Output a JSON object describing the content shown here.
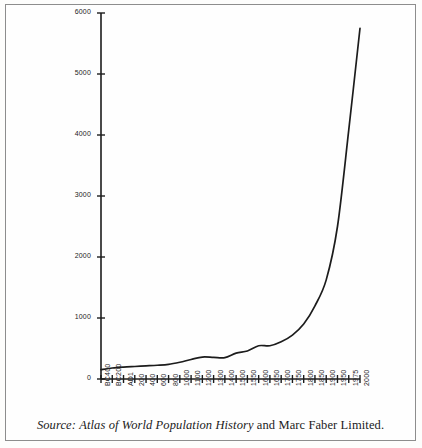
{
  "figure": {
    "border_color": "#8d8d8d",
    "background": "#fefefe"
  },
  "caption": {
    "source_label": "Source:",
    "title_italic": "Atlas of World Population History",
    "tail": "and Marc Faber Limited."
  },
  "chart_data": {
    "type": "line",
    "title": "",
    "xlabel": "",
    "ylabel": "",
    "ylim": [
      0,
      6000
    ],
    "grid": false,
    "legend": null,
    "line_color": "#1c1c1c",
    "y_ticks": [
      0,
      1000,
      2000,
      3000,
      4000,
      5000,
      6000
    ],
    "y_tick_labels": [
      "0",
      "1000",
      "2000",
      "3000",
      "4000",
      "5000",
      "6000"
    ],
    "categories": [
      "BC400",
      "BC200",
      "AD1",
      "200",
      "400",
      "600",
      "800",
      "1000",
      "1100",
      "1200",
      "1300",
      "1400",
      "1500",
      "1550",
      "1600",
      "1650",
      "1700",
      "1750",
      "1800",
      "1850",
      "1900",
      "1950",
      "1975",
      "2000"
    ],
    "values": [
      153,
      180,
      195,
      205,
      215,
      225,
      240,
      275,
      320,
      360,
      355,
      350,
      425,
      460,
      545,
      545,
      610,
      720,
      900,
      1200,
      1625,
      2500,
      4080,
      5750
    ],
    "series_name": "World population (millions)"
  }
}
